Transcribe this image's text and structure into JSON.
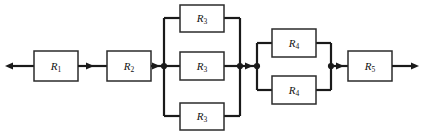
{
  "figure": {
    "name": "resistor-network-schematic",
    "type": "electrical-circuit-diagram",
    "width": 424,
    "height": 135,
    "background_color": "#ffffff",
    "wire_color": "#1a1a1a",
    "box_fill_color": "#ffffff",
    "box_stroke_color": "#2b2b2b",
    "label_color": "#111111"
  },
  "terminals": {
    "left": {
      "label": "",
      "arrow_direction": "left",
      "x": 6,
      "y": 66
    },
    "right": {
      "label": "",
      "arrow_direction": "right",
      "x": 418,
      "y": 66
    }
  },
  "main_line_y": 66,
  "components": [
    {
      "id": "R1",
      "letter": "R",
      "subscript": "1",
      "group": "series",
      "box": {
        "x": 34,
        "y": 51,
        "w": 44,
        "h": 30
      }
    },
    {
      "id": "R2",
      "letter": "R",
      "subscript": "2",
      "group": "series",
      "box": {
        "x": 107,
        "y": 51,
        "w": 44,
        "h": 30
      }
    },
    {
      "id": "R3-top",
      "letter": "R",
      "subscript": "3",
      "group": "parallel-r3",
      "branch": "top",
      "box": {
        "x": 180,
        "y": 5,
        "w": 44,
        "h": 27
      }
    },
    {
      "id": "R3-mid",
      "letter": "R",
      "subscript": "3",
      "group": "parallel-r3",
      "branch": "middle",
      "box": {
        "x": 180,
        "y": 52,
        "w": 44,
        "h": 28
      }
    },
    {
      "id": "R3-bot",
      "letter": "R",
      "subscript": "3",
      "group": "parallel-r3",
      "branch": "bottom",
      "box": {
        "x": 180,
        "y": 103,
        "w": 44,
        "h": 27
      }
    },
    {
      "id": "R4-top",
      "letter": "R",
      "subscript": "4",
      "group": "parallel-r4",
      "branch": "top",
      "box": {
        "x": 272,
        "y": 29,
        "w": 44,
        "h": 28
      }
    },
    {
      "id": "R4-bot",
      "letter": "R",
      "subscript": "4",
      "group": "parallel-r4",
      "branch": "bottom",
      "box": {
        "x": 272,
        "y": 76,
        "w": 44,
        "h": 28
      }
    },
    {
      "id": "R5",
      "letter": "R",
      "subscript": "5",
      "group": "series",
      "box": {
        "x": 348,
        "y": 51,
        "w": 44,
        "h": 30
      }
    }
  ],
  "junction_dots": [
    {
      "name": "node-after-r2",
      "x": 164,
      "y": 66
    },
    {
      "name": "node-r3-right",
      "x": 240,
      "y": 66
    },
    {
      "name": "node-r4-left",
      "x": 257,
      "y": 66
    },
    {
      "name": "node-r4-right",
      "x": 331,
      "y": 66
    }
  ],
  "direction_markers": [
    {
      "name": "marker-after-r1",
      "x": 90,
      "y": 66
    },
    {
      "name": "marker-after-r2",
      "x": 156,
      "y": 66
    },
    {
      "name": "marker-between-groups",
      "x": 249,
      "y": 66
    },
    {
      "name": "marker-before-r5",
      "x": 340,
      "y": 66
    }
  ],
  "parallel_groups": [
    {
      "name": "r3-bank",
      "left_rail_x": 164,
      "right_rail_x": 240,
      "branch_count": 3,
      "branch_ys": [
        18,
        66,
        116
      ]
    },
    {
      "name": "r4-bank",
      "left_rail_x": 257,
      "right_rail_x": 331,
      "branch_count": 2,
      "branch_ys": [
        43,
        90
      ]
    }
  ]
}
